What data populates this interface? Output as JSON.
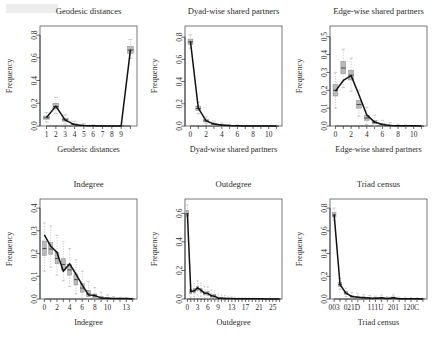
{
  "figure": {
    "kind": "gof-diagnostic-grid",
    "rows": 2,
    "cols": 3,
    "ylabel": "Frequency"
  },
  "chart_data": [
    {
      "type": "boxplot",
      "title": "Geodesic distances",
      "xlabel": "Geodesic distances",
      "ylabel": "Frequency",
      "ylim": [
        0,
        0.88
      ],
      "yticks": [
        0.0,
        0.2,
        0.4,
        0.6,
        0.8
      ],
      "ytick_labels": [
        "0.0",
        "0.2",
        "0.4",
        "0.6",
        "0.8"
      ],
      "categories": [
        "1",
        "2",
        "3",
        "4",
        "5",
        "6",
        "7",
        "8",
        "9",
        "Inf"
      ],
      "xtick_labels": [
        "1",
        "2",
        "3",
        "4",
        "5",
        "6",
        "7",
        "8",
        "9",
        ""
      ],
      "observed": [
        0.075,
        0.175,
        0.052,
        0.012,
        0.004,
        0.002,
        0.001,
        0.001,
        0.001,
        0.672
      ],
      "box_median": [
        0.072,
        0.172,
        0.055,
        0.013,
        0.004,
        0.002,
        0.001,
        0.001,
        0.001,
        0.668
      ],
      "box_q1": [
        0.06,
        0.15,
        0.042,
        0.008,
        0.002,
        0.001,
        0.0,
        0.0,
        0.0,
        0.64
      ],
      "box_q3": [
        0.088,
        0.2,
        0.068,
        0.02,
        0.008,
        0.004,
        0.002,
        0.001,
        0.001,
        0.7
      ],
      "whisk_lo": [
        0.035,
        0.11,
        0.018,
        0.0,
        0.0,
        0.0,
        0.0,
        0.0,
        0.0,
        0.595
      ],
      "whisk_hi": [
        0.118,
        0.252,
        0.098,
        0.042,
        0.02,
        0.01,
        0.006,
        0.004,
        0.003,
        0.76
      ]
    },
    {
      "type": "boxplot",
      "title": "Dyad-wise shared partners",
      "xlabel": "Dyad-wise shared partners",
      "ylim": [
        0,
        0.9
      ],
      "yticks": [
        0.0,
        0.2,
        0.4,
        0.6,
        0.8
      ],
      "ytick_labels": [
        "0.0",
        "0.2",
        "0.4",
        "0.6",
        "0.8"
      ],
      "categories": [
        "0",
        "1",
        "2",
        "3",
        "4",
        "5",
        "6",
        "7",
        "8",
        "9",
        "10",
        "11"
      ],
      "xtick_labels": [
        "0",
        "",
        "2",
        "",
        "4",
        "",
        "6",
        "",
        "8",
        "",
        "10",
        ""
      ],
      "observed": [
        0.76,
        0.16,
        0.046,
        0.018,
        0.008,
        0.004,
        0.002,
        0.001,
        0.001,
        0.001,
        0.0,
        0.0
      ],
      "box_median": [
        0.758,
        0.158,
        0.047,
        0.018,
        0.008,
        0.004,
        0.002,
        0.001,
        0.001,
        0.001,
        0.0,
        0.0
      ],
      "box_q1": [
        0.735,
        0.14,
        0.036,
        0.012,
        0.004,
        0.002,
        0.001,
        0.0,
        0.0,
        0.0,
        0.0,
        0.0
      ],
      "box_q3": [
        0.782,
        0.18,
        0.058,
        0.026,
        0.013,
        0.007,
        0.004,
        0.002,
        0.001,
        0.001,
        0.001,
        0.0
      ],
      "whisk_lo": [
        0.7,
        0.11,
        0.018,
        0.002,
        0.0,
        0.0,
        0.0,
        0.0,
        0.0,
        0.0,
        0.0,
        0.0
      ],
      "whisk_hi": [
        0.82,
        0.215,
        0.082,
        0.045,
        0.026,
        0.016,
        0.01,
        0.006,
        0.004,
        0.003,
        0.002,
        0.001
      ]
    },
    {
      "type": "boxplot",
      "title": "Edge-wise shared partners",
      "xlabel": "Edge-wise shared partners",
      "ylim": [
        0,
        0.56
      ],
      "yticks": [
        0.0,
        0.1,
        0.2,
        0.3,
        0.4,
        0.5
      ],
      "ytick_labels": [
        "0.0",
        "0.1",
        "0.2",
        "0.3",
        "0.4",
        "0.5"
      ],
      "categories": [
        "0",
        "1",
        "2",
        "3",
        "4",
        "5",
        "6",
        "7",
        "8",
        "9",
        "10",
        "11"
      ],
      "xtick_labels": [
        "0",
        "",
        "2",
        "",
        "4",
        "",
        "6",
        "",
        "8",
        "",
        "10",
        ""
      ],
      "observed": [
        0.195,
        0.255,
        0.282,
        0.175,
        0.062,
        0.022,
        0.008,
        0.003,
        0.002,
        0.001,
        0.001,
        0.0
      ],
      "box_median": [
        0.2,
        0.325,
        0.285,
        0.12,
        0.045,
        0.02,
        0.007,
        0.003,
        0.001,
        0.001,
        0.0,
        0.0
      ],
      "box_q1": [
        0.168,
        0.292,
        0.258,
        0.1,
        0.032,
        0.012,
        0.003,
        0.001,
        0.0,
        0.0,
        0.0,
        0.0
      ],
      "box_q3": [
        0.232,
        0.362,
        0.312,
        0.142,
        0.06,
        0.03,
        0.013,
        0.006,
        0.003,
        0.001,
        0.001,
        0.0
      ],
      "whisk_lo": [
        0.1,
        0.215,
        0.195,
        0.055,
        0.008,
        0.0,
        0.0,
        0.0,
        0.0,
        0.0,
        0.0,
        0.0
      ],
      "whisk_hi": [
        0.3,
        0.43,
        0.38,
        0.2,
        0.105,
        0.06,
        0.032,
        0.018,
        0.01,
        0.005,
        0.003,
        0.001
      ]
    },
    {
      "type": "boxplot",
      "title": "Indegree",
      "xlabel": "Indegree",
      "ylim": [
        0,
        0.44
      ],
      "yticks": [
        0.0,
        0.1,
        0.2,
        0.3,
        0.4
      ],
      "ytick_labels": [
        "0.0",
        "0.1",
        "0.2",
        "0.3",
        "0.4"
      ],
      "categories": [
        "0",
        "1",
        "2",
        "3",
        "4",
        "5",
        "6",
        "7",
        "8",
        "9",
        "10",
        "11",
        "12",
        "13",
        "14"
      ],
      "xtick_labels": [
        "0",
        "",
        "2",
        "",
        "4",
        "",
        "6",
        "",
        "8",
        "",
        "10",
        "",
        "",
        "13",
        ""
      ],
      "observed": [
        0.282,
        0.232,
        0.205,
        0.122,
        0.155,
        0.11,
        0.062,
        0.018,
        0.016,
        0.004,
        0.003,
        0.002,
        0.002,
        0.002,
        0.001
      ],
      "box_median": [
        0.222,
        0.22,
        0.178,
        0.152,
        0.128,
        0.085,
        0.048,
        0.022,
        0.012,
        0.005,
        0.003,
        0.002,
        0.001,
        0.001,
        0.0
      ],
      "box_q1": [
        0.192,
        0.196,
        0.155,
        0.128,
        0.105,
        0.062,
        0.03,
        0.01,
        0.004,
        0.001,
        0.0,
        0.0,
        0.0,
        0.0,
        0.0
      ],
      "box_q3": [
        0.255,
        0.248,
        0.205,
        0.178,
        0.152,
        0.11,
        0.068,
        0.038,
        0.022,
        0.012,
        0.006,
        0.004,
        0.002,
        0.002,
        0.001
      ],
      "whisk_lo": [
        0.122,
        0.14,
        0.105,
        0.08,
        0.055,
        0.022,
        0.004,
        0.0,
        0.0,
        0.0,
        0.0,
        0.0,
        0.0,
        0.0,
        0.0
      ],
      "whisk_hi": [
        0.335,
        0.322,
        0.28,
        0.252,
        0.222,
        0.172,
        0.122,
        0.078,
        0.05,
        0.03,
        0.018,
        0.011,
        0.007,
        0.005,
        0.003
      ]
    },
    {
      "type": "boxplot",
      "title": "Outdegree",
      "xlabel": "Outdegree",
      "ylim": [
        0,
        0.7
      ],
      "yticks": [
        0.0,
        0.2,
        0.4,
        0.6
      ],
      "ytick_labels": [
        "0.0",
        "0.2",
        "0.4",
        "0.6"
      ],
      "categories": [
        "0",
        "1",
        "2",
        "3",
        "4",
        "5",
        "6",
        "7",
        "8",
        "9",
        "10",
        "11",
        "12",
        "13",
        "14",
        "15",
        "16",
        "17",
        "18",
        "19",
        "20",
        "21",
        "22",
        "23",
        "24",
        "25",
        "26",
        "27"
      ],
      "xtick_labels": [
        "0",
        "",
        "",
        "3",
        "",
        "",
        "6",
        "",
        "",
        "9",
        "",
        "",
        "",
        "13",
        "",
        "",
        "",
        "17",
        "",
        "",
        "",
        "21",
        "",
        "",
        "",
        "25",
        "",
        ""
      ],
      "observed": [
        0.6,
        0.052,
        0.058,
        0.078,
        0.062,
        0.04,
        0.04,
        0.022,
        0.02,
        0.006,
        0.005,
        0.004,
        0.003,
        0.003,
        0.002,
        0.002,
        0.002,
        0.001,
        0.001,
        0.001,
        0.001,
        0.001,
        0.001,
        0.0,
        0.0,
        0.0,
        0.0,
        0.0
      ],
      "box_median": [
        0.598,
        0.05,
        0.055,
        0.072,
        0.058,
        0.04,
        0.038,
        0.022,
        0.018,
        0.006,
        0.005,
        0.004,
        0.003,
        0.002,
        0.002,
        0.002,
        0.001,
        0.001,
        0.001,
        0.001,
        0.001,
        0.0,
        0.0,
        0.0,
        0.0,
        0.0,
        0.0,
        0.0
      ],
      "box_q1": [
        0.578,
        0.038,
        0.042,
        0.058,
        0.045,
        0.028,
        0.026,
        0.012,
        0.009,
        0.002,
        0.002,
        0.001,
        0.001,
        0.001,
        0.0,
        0.0,
        0.0,
        0.0,
        0.0,
        0.0,
        0.0,
        0.0,
        0.0,
        0.0,
        0.0,
        0.0,
        0.0,
        0.0
      ],
      "box_q3": [
        0.62,
        0.066,
        0.072,
        0.09,
        0.074,
        0.054,
        0.052,
        0.034,
        0.03,
        0.013,
        0.01,
        0.008,
        0.006,
        0.005,
        0.004,
        0.003,
        0.003,
        0.002,
        0.002,
        0.001,
        0.001,
        0.001,
        0.001,
        0.0,
        0.0,
        0.0,
        0.0,
        0.0
      ],
      "whisk_lo": [
        0.54,
        0.012,
        0.016,
        0.028,
        0.018,
        0.006,
        0.004,
        0.0,
        0.0,
        0.0,
        0.0,
        0.0,
        0.0,
        0.0,
        0.0,
        0.0,
        0.0,
        0.0,
        0.0,
        0.0,
        0.0,
        0.0,
        0.0,
        0.0,
        0.0,
        0.0,
        0.0,
        0.0
      ],
      "whisk_hi": [
        0.66,
        0.098,
        0.108,
        0.13,
        0.112,
        0.088,
        0.086,
        0.064,
        0.058,
        0.034,
        0.028,
        0.024,
        0.02,
        0.017,
        0.014,
        0.012,
        0.01,
        0.008,
        0.007,
        0.006,
        0.005,
        0.004,
        0.003,
        0.002,
        0.002,
        0.001,
        0.001,
        0.001
      ]
    },
    {
      "type": "boxplot",
      "title": "Triad census",
      "xlabel": "Triad census",
      "ylim": [
        0,
        0.88
      ],
      "yticks": [
        0.0,
        0.2,
        0.4,
        0.6,
        0.8
      ],
      "ytick_labels": [
        "0.0",
        "0.2",
        "0.4",
        "0.6",
        "0.8"
      ],
      "categories": [
        "003",
        "012",
        "102",
        "021D",
        "021U",
        "021C",
        "111D",
        "111U",
        "030T",
        "030C",
        "201",
        "120D",
        "120U",
        "120C",
        "210",
        "300"
      ],
      "xtick_labels": [
        "003",
        "",
        "",
        "021D",
        "",
        "",
        "",
        "111U",
        "",
        "",
        "201",
        "",
        "",
        "120C",
        "",
        ""
      ],
      "observed": [
        0.742,
        0.125,
        0.052,
        0.022,
        0.016,
        0.012,
        0.008,
        0.006,
        0.01,
        0.004,
        0.012,
        0.003,
        0.003,
        0.002,
        0.002,
        0.001
      ],
      "box_median": [
        0.74,
        0.128,
        0.053,
        0.022,
        0.015,
        0.012,
        0.008,
        0.006,
        0.009,
        0.004,
        0.011,
        0.003,
        0.003,
        0.002,
        0.002,
        0.001
      ],
      "box_q1": [
        0.722,
        0.112,
        0.042,
        0.014,
        0.009,
        0.006,
        0.003,
        0.002,
        0.004,
        0.001,
        0.005,
        0.001,
        0.001,
        0.0,
        0.0,
        0.0
      ],
      "box_q3": [
        0.76,
        0.145,
        0.065,
        0.032,
        0.024,
        0.019,
        0.014,
        0.011,
        0.016,
        0.008,
        0.018,
        0.006,
        0.006,
        0.004,
        0.004,
        0.002
      ],
      "whisk_lo": [
        0.69,
        0.085,
        0.022,
        0.0,
        0.0,
        0.0,
        0.0,
        0.0,
        0.0,
        0.0,
        0.0,
        0.0,
        0.0,
        0.0,
        0.0,
        0.0
      ],
      "whisk_hi": [
        0.8,
        0.18,
        0.095,
        0.058,
        0.045,
        0.038,
        0.03,
        0.026,
        0.034,
        0.02,
        0.036,
        0.016,
        0.016,
        0.012,
        0.011,
        0.007
      ]
    }
  ]
}
